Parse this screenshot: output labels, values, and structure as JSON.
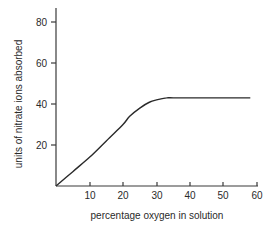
{
  "chart_data": {
    "type": "line",
    "title": "",
    "xlabel": "percentage oxygen in solution",
    "ylabel": "units of nitrate ions absorbed",
    "xlim": [
      0,
      60
    ],
    "ylim": [
      0,
      85
    ],
    "xticks": [
      10,
      20,
      30,
      40,
      50,
      60
    ],
    "yticks": [
      20,
      40,
      60,
      80
    ],
    "grid": false,
    "legend": null,
    "series": [
      {
        "name": "nitrate absorption",
        "x": [
          0,
          5,
          10,
          15,
          20,
          22,
          25,
          28,
          30,
          33,
          35,
          40,
          45,
          50,
          55,
          58
        ],
        "y": [
          0,
          7,
          14,
          22,
          30,
          34,
          38,
          41,
          42,
          43,
          43,
          43,
          43,
          43,
          43,
          43
        ]
      }
    ]
  },
  "labels": {
    "xlabel": "percentage oxygen in solution",
    "ylabel": "units of nitrate ions absorbed",
    "xticks": [
      "10",
      "20",
      "30",
      "40",
      "50",
      "60"
    ],
    "yticks": [
      "20",
      "40",
      "60",
      "80"
    ]
  }
}
